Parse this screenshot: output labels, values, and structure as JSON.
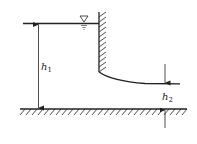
{
  "diagram": {
    "type": "sluice-gate-flow",
    "labels": {
      "upstream_depth": {
        "base": "h",
        "sub": "1"
      },
      "downstream_depth": {
        "base": "h",
        "sub": "2"
      }
    },
    "symbols": {
      "water_surface": "free-surface-triangle"
    },
    "colors": {
      "stroke": "#222222",
      "background": "#ffffff"
    }
  }
}
